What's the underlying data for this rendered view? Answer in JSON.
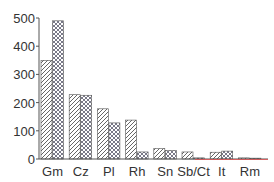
{
  "chart_data": {
    "type": "bar",
    "title": "",
    "xlabel": "",
    "ylabel": "",
    "ylim": [
      0,
      500
    ],
    "yticks": [
      0,
      100,
      200,
      300,
      400,
      500
    ],
    "grid": false,
    "legend": null,
    "categories": [
      "Gm",
      "Cz",
      "Pl",
      "Rh",
      "Sn",
      "Sb/Ct",
      "It",
      "Rm"
    ],
    "series": [
      {
        "name": "Series 1 (diagonal hatch)",
        "pattern": "diagonal",
        "values": [
          350,
          228,
          178,
          138,
          37,
          25,
          24,
          4
        ]
      },
      {
        "name": "Series 2 (cross-hatch)",
        "pattern": "crosshatch",
        "values": [
          490,
          226,
          128,
          25,
          30,
          4,
          28,
          3
        ]
      }
    ],
    "colors": {
      "axis": "#555555",
      "hatch": "#555555",
      "crosshatch": "#6a6a7a",
      "baseline_accent": "#e05050"
    }
  }
}
